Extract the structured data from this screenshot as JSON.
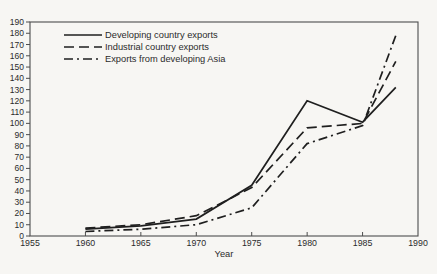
{
  "figure": {
    "background": "#f7f6f3",
    "ink": "#1f1f1f",
    "axis_color": "#4d4d4d",
    "text_color": "#2b2b2b"
  },
  "chart_data": {
    "type": "line",
    "title": "",
    "xlabel": "Year",
    "ylabel": "",
    "xlim": [
      1955,
      1990
    ],
    "ylim": [
      0,
      190
    ],
    "x_ticks": [
      1955,
      1960,
      1965,
      1970,
      1975,
      1980,
      1985,
      1990
    ],
    "y_tick_step": 10,
    "grid": false,
    "legend_position": "upper-left",
    "x": [
      1960,
      1965,
      1970,
      1975,
      1980,
      1985,
      1988
    ],
    "series": [
      {
        "name": "Developing country exports",
        "line_style": "solid",
        "values": [
          6,
          9,
          15,
          45,
          120,
          101,
          132
        ]
      },
      {
        "name": "Industrial country exports",
        "line_style": "dashed",
        "values": [
          7,
          10,
          18,
          43,
          96,
          100,
          155
        ]
      },
      {
        "name": "Exports from developing Asia",
        "line_style": "dash-dot",
        "values": [
          4,
          6,
          10,
          25,
          82,
          98,
          178
        ]
      }
    ]
  }
}
